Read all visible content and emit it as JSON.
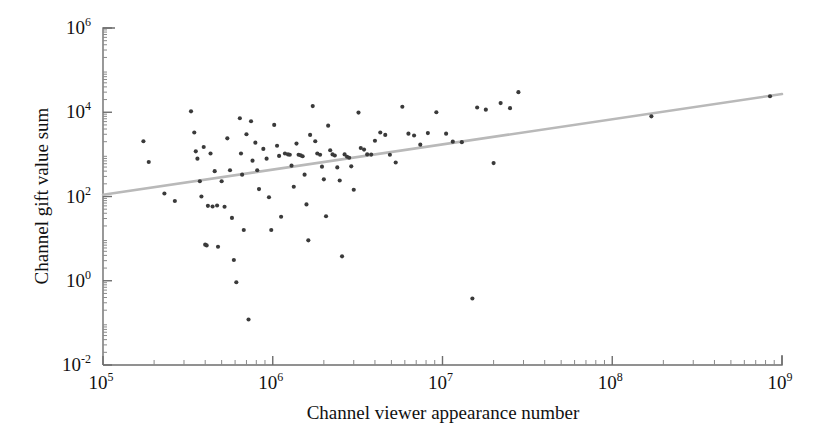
{
  "chart_data": {
    "type": "scatter",
    "title": "",
    "xlabel": "Channel  viewer appearance number",
    "ylabel": "Channel gift value sum",
    "xscale": "log",
    "yscale": "log",
    "xlim": [
      100000,
      1000000000
    ],
    "ylim": [
      0.01,
      1000000
    ],
    "xticks": [
      100000,
      1000000,
      10000000,
      100000000,
      1000000000
    ],
    "xtick_labels": [
      "10⁵",
      "10⁶",
      "10⁷",
      "10⁸",
      "10⁹"
    ],
    "xtick_mantissas": [
      "10",
      "10",
      "10",
      "10",
      "10"
    ],
    "xtick_exponents": [
      "5",
      "6",
      "7",
      "8",
      "9"
    ],
    "yticks": [
      0.01,
      1,
      100,
      10000,
      1000000
    ],
    "ytick_labels": [
      "10⁻²",
      "10⁰",
      "10²",
      "10⁴",
      "10⁶"
    ],
    "ytick_mantissas": [
      "10",
      "10",
      "10",
      "10",
      "10"
    ],
    "ytick_exponents": [
      "-2",
      "0",
      "2",
      "4",
      "6"
    ],
    "grid": false,
    "legend": false,
    "minor_ticks": true,
    "point_color": "#3a3a3a",
    "point_size": 3,
    "trendline": {
      "label": "fit line",
      "color": "#b9b9b9",
      "x": [
        100000,
        1000000000
      ],
      "y": [
        110,
        27000
      ]
    },
    "points": [
      {
        "x": 173000,
        "y": 2050
      },
      {
        "x": 186000,
        "y": 660
      },
      {
        "x": 230000,
        "y": 118
      },
      {
        "x": 265000,
        "y": 78
      },
      {
        "x": 330000,
        "y": 10500
      },
      {
        "x": 345000,
        "y": 3300
      },
      {
        "x": 352000,
        "y": 1180
      },
      {
        "x": 360000,
        "y": 790
      },
      {
        "x": 372000,
        "y": 230
      },
      {
        "x": 380000,
        "y": 100
      },
      {
        "x": 392000,
        "y": 1500
      },
      {
        "x": 400000,
        "y": 7.2
      },
      {
        "x": 408000,
        "y": 6.9
      },
      {
        "x": 415000,
        "y": 60
      },
      {
        "x": 430000,
        "y": 1050
      },
      {
        "x": 442000,
        "y": 58
      },
      {
        "x": 455000,
        "y": 400
      },
      {
        "x": 470000,
        "y": 61
      },
      {
        "x": 476000,
        "y": 6.4
      },
      {
        "x": 500000,
        "y": 230
      },
      {
        "x": 520000,
        "y": 57
      },
      {
        "x": 540000,
        "y": 2400
      },
      {
        "x": 560000,
        "y": 420
      },
      {
        "x": 575000,
        "y": 31
      },
      {
        "x": 590000,
        "y": 3.1
      },
      {
        "x": 610000,
        "y": 0.92
      },
      {
        "x": 640000,
        "y": 7200
      },
      {
        "x": 650000,
        "y": 1050
      },
      {
        "x": 660000,
        "y": 330
      },
      {
        "x": 675000,
        "y": 16
      },
      {
        "x": 700000,
        "y": 3000
      },
      {
        "x": 720000,
        "y": 0.12
      },
      {
        "x": 745000,
        "y": 6100
      },
      {
        "x": 760000,
        "y": 710
      },
      {
        "x": 790000,
        "y": 1900
      },
      {
        "x": 810000,
        "y": 420
      },
      {
        "x": 830000,
        "y": 150
      },
      {
        "x": 880000,
        "y": 1350
      },
      {
        "x": 920000,
        "y": 790
      },
      {
        "x": 950000,
        "y": 96
      },
      {
        "x": 980000,
        "y": 16
      },
      {
        "x": 1020000,
        "y": 5000
      },
      {
        "x": 1060000,
        "y": 1600
      },
      {
        "x": 1090000,
        "y": 920
      },
      {
        "x": 1120000,
        "y": 33
      },
      {
        "x": 1180000,
        "y": 1050
      },
      {
        "x": 1230000,
        "y": 1000
      },
      {
        "x": 1260000,
        "y": 980
      },
      {
        "x": 1290000,
        "y": 540
      },
      {
        "x": 1330000,
        "y": 170
      },
      {
        "x": 1380000,
        "y": 1800
      },
      {
        "x": 1420000,
        "y": 980
      },
      {
        "x": 1460000,
        "y": 950
      },
      {
        "x": 1500000,
        "y": 900
      },
      {
        "x": 1540000,
        "y": 330
      },
      {
        "x": 1580000,
        "y": 65
      },
      {
        "x": 1620000,
        "y": 9.1
      },
      {
        "x": 1660000,
        "y": 2900
      },
      {
        "x": 1720000,
        "y": 14000
      },
      {
        "x": 1780000,
        "y": 2050
      },
      {
        "x": 1830000,
        "y": 1050
      },
      {
        "x": 1900000,
        "y": 980
      },
      {
        "x": 1950000,
        "y": 510
      },
      {
        "x": 2000000,
        "y": 255
      },
      {
        "x": 2060000,
        "y": 34
      },
      {
        "x": 2120000,
        "y": 4800
      },
      {
        "x": 2180000,
        "y": 1250
      },
      {
        "x": 2250000,
        "y": 1000
      },
      {
        "x": 2320000,
        "y": 940
      },
      {
        "x": 2400000,
        "y": 490
      },
      {
        "x": 2480000,
        "y": 240
      },
      {
        "x": 2560000,
        "y": 3.8
      },
      {
        "x": 2650000,
        "y": 1000
      },
      {
        "x": 2740000,
        "y": 880
      },
      {
        "x": 2820000,
        "y": 830
      },
      {
        "x": 2900000,
        "y": 520
      },
      {
        "x": 3000000,
        "y": 145
      },
      {
        "x": 3200000,
        "y": 9800
      },
      {
        "x": 3300000,
        "y": 1420
      },
      {
        "x": 3450000,
        "y": 1300
      },
      {
        "x": 3600000,
        "y": 1000
      },
      {
        "x": 3800000,
        "y": 990
      },
      {
        "x": 4000000,
        "y": 2100
      },
      {
        "x": 4300000,
        "y": 3300
      },
      {
        "x": 4600000,
        "y": 2900
      },
      {
        "x": 4900000,
        "y": 980
      },
      {
        "x": 5300000,
        "y": 640
      },
      {
        "x": 5800000,
        "y": 13500
      },
      {
        "x": 6300000,
        "y": 3100
      },
      {
        "x": 6800000,
        "y": 2800
      },
      {
        "x": 7400000,
        "y": 1700
      },
      {
        "x": 8200000,
        "y": 3200
      },
      {
        "x": 9200000,
        "y": 10000
      },
      {
        "x": 10500000,
        "y": 3100
      },
      {
        "x": 11500000,
        "y": 2000
      },
      {
        "x": 13000000,
        "y": 1950
      },
      {
        "x": 15000000,
        "y": 0.38
      },
      {
        "x": 16000000,
        "y": 13000
      },
      {
        "x": 18000000,
        "y": 11500
      },
      {
        "x": 20000000,
        "y": 620
      },
      {
        "x": 22000000,
        "y": 16500
      },
      {
        "x": 25000000,
        "y": 12500
      },
      {
        "x": 28000000,
        "y": 30000
      },
      {
        "x": 170000000,
        "y": 8000
      },
      {
        "x": 850000000,
        "y": 24000
      }
    ]
  }
}
